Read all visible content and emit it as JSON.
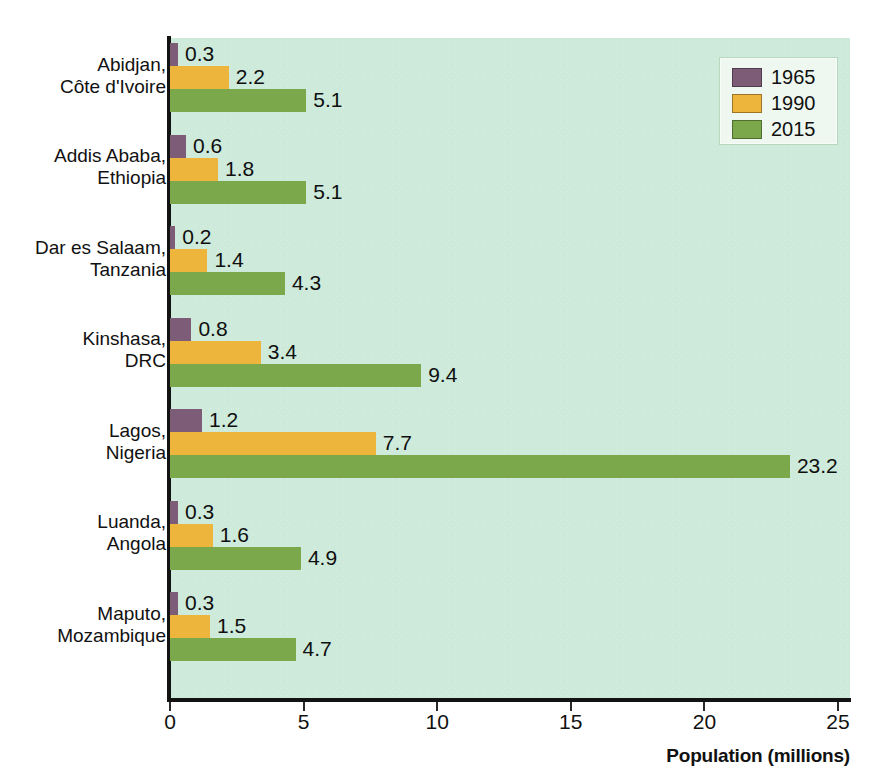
{
  "chart_data": {
    "type": "bar",
    "orientation": "horizontal",
    "title": "",
    "xlabel": "Population (millions)",
    "ylabel": "",
    "xlim": [
      0,
      25
    ],
    "xticks": [
      "0",
      "5",
      "10",
      "15",
      "20",
      "25"
    ],
    "grid": false,
    "legend_position": "top-right",
    "categories": [
      "Abidjan, Côte d'Ivoire",
      "Addis Ababa, Ethiopia",
      "Dar es Salaam, Tanzania",
      "Kinshasa, DRC",
      "Lagos, Nigeria",
      "Luanda, Angola",
      "Maputo, Mozambique"
    ],
    "category_lines": [
      [
        "Abidjan,",
        "Côte d'Ivoire"
      ],
      [
        "Addis Ababa,",
        "Ethiopia"
      ],
      [
        "Dar es Salaam,",
        "Tanzania"
      ],
      [
        "Kinshasa,",
        "DRC"
      ],
      [
        "Lagos,",
        "Nigeria"
      ],
      [
        "Luanda,",
        "Angola"
      ],
      [
        "Maputo,",
        "Mozambique"
      ]
    ],
    "series": [
      {
        "name": "1965",
        "color": "#7d5c78",
        "values": [
          0.3,
          0.6,
          0.2,
          0.8,
          1.2,
          0.3,
          0.3
        ],
        "labels": [
          "0.3",
          "0.6",
          "0.2",
          "0.8",
          "1.2",
          "0.3",
          "0.3"
        ]
      },
      {
        "name": "1990",
        "color": "#eeb53c",
        "values": [
          2.2,
          1.8,
          1.4,
          3.4,
          7.7,
          1.6,
          1.5
        ],
        "labels": [
          "2.2",
          "1.8",
          "1.4",
          "3.4",
          "7.7",
          "1.6",
          "1.5"
        ]
      },
      {
        "name": "2015",
        "color": "#7aa84b",
        "values": [
          5.1,
          5.1,
          4.3,
          9.4,
          23.2,
          4.9,
          4.7
        ],
        "labels": [
          "5.1",
          "5.1",
          "4.3",
          "9.4",
          "23.2",
          "4.9",
          "4.7"
        ]
      }
    ]
  },
  "legend": {
    "entries": [
      {
        "label": "1965",
        "color": "#7d5c78"
      },
      {
        "label": "1990",
        "color": "#eeb53c"
      },
      {
        "label": "2015",
        "color": "#7aa84b"
      }
    ]
  },
  "axis": {
    "x_title": "Population (millions)"
  },
  "colors": {
    "plot_background": "#cdeada",
    "axis": "#131313",
    "text": "#111111",
    "series_1965": "#7d5c78",
    "series_1990": "#eeb53c",
    "series_2015": "#7aa84b"
  }
}
